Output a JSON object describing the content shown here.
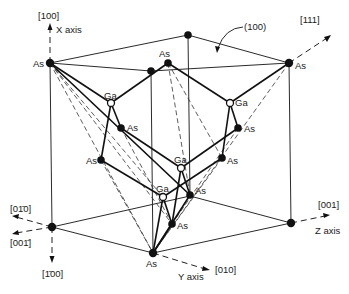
{
  "figure": {
    "axes": {
      "x": {
        "direction": "[100]",
        "label": "X axis"
      },
      "y": {
        "direction": "[010]",
        "label": "Y axis"
      },
      "z": {
        "direction": "[001]",
        "label": "Z axis"
      },
      "neg_x": {
        "direction": "[1̄00]"
      },
      "neg_y": {
        "direction": "[01̄0]"
      },
      "neg_z": {
        "direction": "[001̄]"
      },
      "diag": {
        "direction": "[111]"
      }
    },
    "plane_label": "(100)",
    "atom_labels": {
      "as": "As",
      "ga": "Ga"
    },
    "caption": ""
  }
}
